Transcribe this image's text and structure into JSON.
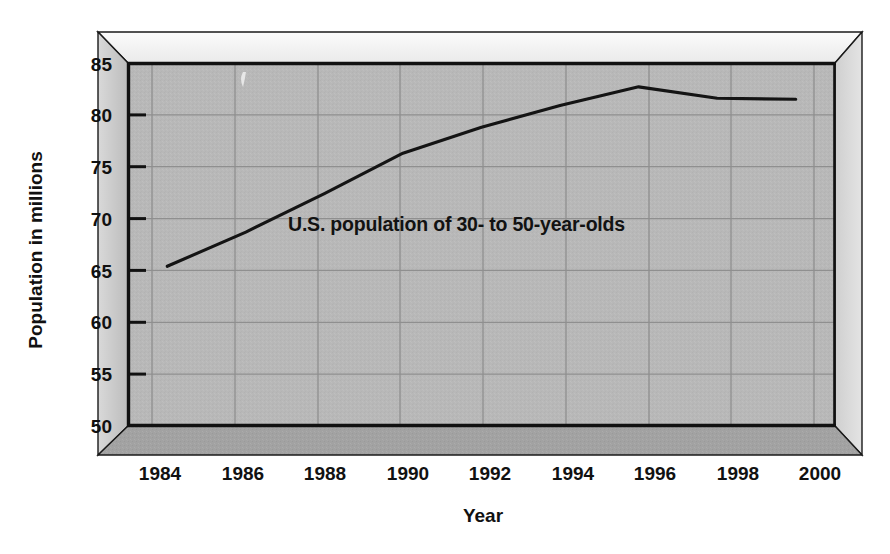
{
  "chart_data": {
    "type": "line",
    "title": "",
    "subtitle": "",
    "xlabel": "Year",
    "ylabel": "Population in millions",
    "xlim": [
      1983,
      2001
    ],
    "ylim": [
      50,
      85
    ],
    "grid": true,
    "legend_position": "inline-annotation",
    "series": [
      {
        "name": "U.S. population of 30- to 50-year-olds",
        "x": [
          1984,
          1986,
          1988,
          1990,
          1992,
          1994,
          1996,
          1998,
          2000
        ],
        "values": [
          65.4,
          68.7,
          72.4,
          76.3,
          78.8,
          80.9,
          82.7,
          81.6,
          81.5
        ]
      }
    ],
    "annotations": [
      {
        "text": "U.S. population of 30- to 50-year-olds",
        "x": 1989.4,
        "y": 69.8
      }
    ],
    "x_ticks": [
      1984,
      1986,
      1988,
      1990,
      1992,
      1994,
      1996,
      1998,
      2000
    ],
    "x_tick_labels": [
      "1984",
      "1986",
      "1988",
      "1990",
      "1992",
      "1994",
      "1996",
      "1998",
      "2000"
    ],
    "y_ticks": [
      50,
      55,
      60,
      65,
      70,
      75,
      80,
      85
    ],
    "y_tick_labels": [
      "50",
      "55",
      "60",
      "65",
      "70",
      "75",
      "80",
      "85"
    ]
  },
  "axes": {
    "y_axis_title": "Population in millions",
    "x_axis_title": "Year",
    "y_tick_labels": [
      "85",
      "80",
      "75",
      "70",
      "65",
      "60",
      "55",
      "50"
    ],
    "x_tick_labels": [
      "1984",
      "1986",
      "1988",
      "1990",
      "1992",
      "1994",
      "1996",
      "1998",
      "2000"
    ]
  },
  "series_label": "U.S. population of 30- to 50-year-olds",
  "colors": {
    "page_background": "#ffffff",
    "plot_background": "#b8b8b8",
    "gridline": "#8f8f8f",
    "data_line": "#141414",
    "axis_line": "#111111",
    "frame_top_face": "#f2f2f2",
    "frame_left_face": "#c9c9c9",
    "frame_right_face": "#d6d6d6",
    "frame_bottom_face": "#a0a0a0",
    "tick_text": "#111111"
  }
}
